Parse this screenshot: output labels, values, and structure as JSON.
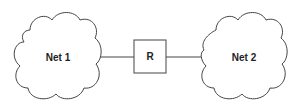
{
  "diagram": {
    "nodes": [
      {
        "id": "net1",
        "label": "Net 1",
        "shape": "cloud"
      },
      {
        "id": "router",
        "label": "R",
        "shape": "box"
      },
      {
        "id": "net2",
        "label": "Net 2",
        "shape": "cloud"
      }
    ],
    "edges": [
      {
        "from": "net1",
        "to": "router"
      },
      {
        "from": "router",
        "to": "net2"
      }
    ],
    "colors": {
      "stroke": "#444444",
      "text": "#222222",
      "background": "#ffffff"
    }
  }
}
